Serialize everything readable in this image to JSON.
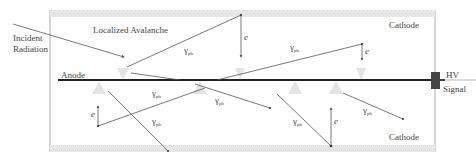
{
  "labels": {
    "incident_line1": "Incident",
    "incident_line2": "Radiation",
    "localized_avalanche": "Localized Avalanche",
    "cathode_top": "Cathode",
    "cathode_bottom": "Cathode",
    "anode": "Anode",
    "hv": "HV",
    "signal": "Signal",
    "electron": "e",
    "gamma": "γ",
    "gamma_sub": "ph"
  },
  "colors": {
    "cathode_fill": "#e6e6e6",
    "anode": "#222222",
    "connector": "#444444",
    "line": "#555555",
    "avalanche": "#e4e4e4",
    "frame": "#aaaaaa"
  }
}
